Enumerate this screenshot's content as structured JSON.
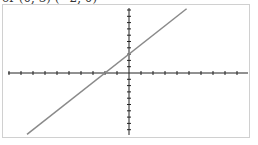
{
  "header": {
    "text": "or (0, 3) (−2, 0)"
  },
  "footer": {
    "text": ""
  },
  "colors": {
    "axis": "#222222",
    "line": "#8a8a8a",
    "frame": "#d0d0d0"
  },
  "chart_data": {
    "type": "line",
    "title": "",
    "xlabel": "",
    "ylabel": "",
    "xlim": [
      -10,
      10
    ],
    "ylim": [
      -10,
      10
    ],
    "grid": false,
    "legend": null,
    "series": [
      {
        "name": "y = 1.5x + 3",
        "x": [
          -8.5,
          4.8
        ],
        "y": [
          -9.75,
          10.2
        ]
      }
    ],
    "points_referenced": [
      {
        "label": "(0, 3)",
        "x": 0,
        "y": 3
      },
      {
        "label": "(-2, 0)",
        "x": -2,
        "y": 0
      }
    ],
    "x_ticks_spacing": 1,
    "y_ticks_spacing": 1
  }
}
